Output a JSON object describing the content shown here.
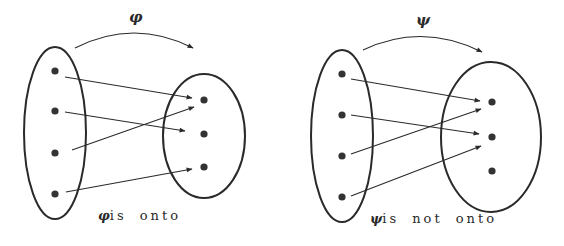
{
  "colors": {
    "stroke": "#2a2a2a",
    "dot": "#333333",
    "background": "#ffffff"
  },
  "diagrams": [
    {
      "id": "phi",
      "function_symbol": "φ",
      "caption_symbol": "φ",
      "caption_text": "is onto",
      "domain": {
        "cx": 55,
        "cy": 133,
        "rx": 31,
        "ry": 86,
        "points": [
          [
            55,
            71
          ],
          [
            55,
            111
          ],
          [
            55,
            153
          ],
          [
            55,
            194
          ]
        ]
      },
      "codomain": {
        "cx": 204,
        "cy": 136,
        "rx": 41,
        "ry": 62,
        "points": [
          [
            204,
            100
          ],
          [
            204,
            134
          ],
          [
            204,
            167
          ]
        ]
      },
      "arrows": [
        {
          "from": [
            65,
            77
          ],
          "to": [
            192,
            98
          ]
        },
        {
          "from": [
            65,
            112
          ],
          "to": [
            185,
            131
          ]
        },
        {
          "from": [
            72,
            150
          ],
          "to": [
            194,
            107
          ]
        },
        {
          "from": [
            66,
            192
          ],
          "to": [
            192,
            169
          ]
        }
      ],
      "arc": {
        "from": [
          75,
          48
        ],
        "ctrl": [
          134,
          18
        ],
        "to": [
          193,
          48
        ]
      },
      "label_pos": [
        129,
        8
      ],
      "caption_pos": [
        98,
        208
      ]
    },
    {
      "id": "psi",
      "function_symbol": "ψ",
      "caption_symbol": "ψ",
      "caption_text": "is not onto",
      "domain": {
        "cx": 342,
        "cy": 136,
        "rx": 31,
        "ry": 86,
        "points": [
          [
            342,
            74
          ],
          [
            342,
            115
          ],
          [
            342,
            156
          ],
          [
            342,
            197
          ]
        ]
      },
      "codomain": {
        "cx": 491,
        "cy": 137,
        "rx": 50,
        "ry": 75,
        "points": [
          [
            492,
            102
          ],
          [
            492,
            137
          ],
          [
            492,
            171
          ]
        ]
      },
      "arrows": [
        {
          "from": [
            351,
            79
          ],
          "to": [
            480,
            101
          ]
        },
        {
          "from": [
            351,
            115
          ],
          "to": [
            479,
            134
          ]
        },
        {
          "from": [
            351,
            154
          ],
          "to": [
            481,
            109
          ]
        },
        {
          "from": [
            351,
            196
          ],
          "to": [
            481,
            146
          ]
        }
      ],
      "arc": {
        "from": [
          363,
          50
        ],
        "ctrl": [
          422,
          22
        ],
        "to": [
          482,
          52
        ]
      },
      "label_pos": [
        416,
        11
      ],
      "caption_pos": [
        370,
        211
      ]
    }
  ]
}
